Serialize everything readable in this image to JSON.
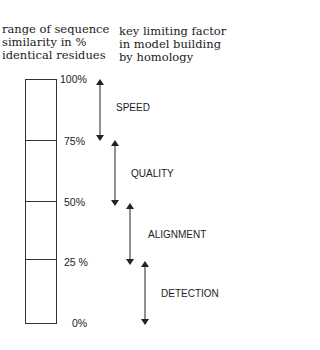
{
  "headers": {
    "left": "range of sequence\nsimilarity in %\nidentical residues",
    "right": "key limiting factor\nin model building\nby homology"
  },
  "scale_labels": [
    "100%",
    "75%",
    "50%",
    "25 %",
    "0%"
  ],
  "factors": [
    "SPEED",
    "QUALITY",
    "ALIGNMENT",
    "DETECTION"
  ],
  "colors": {
    "line": "#333333",
    "text": "#222222"
  }
}
